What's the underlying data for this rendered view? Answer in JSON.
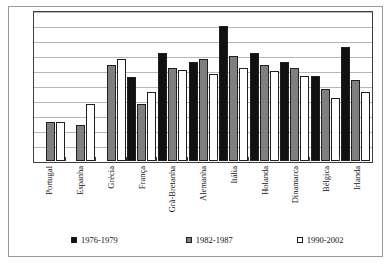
{
  "chart_data": {
    "type": "bar",
    "title": "",
    "xlabel": "",
    "ylabel": "",
    "ylim": [
      0,
      50
    ],
    "yticks": [
      0,
      5,
      10,
      15,
      20,
      25,
      30,
      35,
      40,
      45,
      50
    ],
    "grid": true,
    "legend_position": "bottom",
    "categories": [
      "Portugal",
      "Espanha",
      "Grécia",
      "França",
      "Grã-Bretanha",
      "Alemanha",
      "Itália",
      "Holanda",
      "Dinamarca",
      "Bélgica",
      "Irlanda"
    ],
    "series": [
      {
        "name": "1976-1979",
        "color": "#111111",
        "values": [
          null,
          null,
          null,
          28,
          36,
          33,
          45,
          36,
          33,
          28.5,
          38
        ]
      },
      {
        "name": "1982-1987",
        "color": "#7f7f7f",
        "values": [
          13,
          12,
          32,
          19,
          31,
          34,
          35,
          32,
          31,
          24,
          27
        ]
      },
      {
        "name": "1990-2002",
        "color": "#ffffff",
        "values": [
          13,
          19,
          34,
          23,
          30.5,
          29,
          31,
          30,
          28.5,
          21,
          23
        ]
      }
    ]
  },
  "legend": {
    "items": [
      {
        "label": "1976-1979"
      },
      {
        "label": "1982-1987"
      },
      {
        "label": "1990-2002"
      }
    ]
  }
}
